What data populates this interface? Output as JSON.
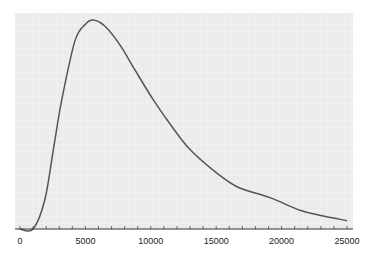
{
  "chart_data": {
    "type": "line",
    "title": "",
    "xlabel": "",
    "ylabel": "",
    "xlim": [
      0,
      25000
    ],
    "ylim": [
      0,
      1.05
    ],
    "grid": true,
    "legend": null,
    "x_ticks": [
      0,
      5000,
      10000,
      15000,
      20000,
      25000
    ],
    "x_tick_labels": [
      "0",
      "5000",
      "10000",
      "15000",
      "20000",
      "25000"
    ],
    "x_minor_tick_step": 1000,
    "series": [
      {
        "name": "curve",
        "color": "#555555",
        "x": [
          0,
          1000,
          1900,
          2600,
          3200,
          4200,
          5000,
          5600,
          6500,
          7650,
          8800,
          10170,
          11500,
          13000,
          15000,
          16670,
          19100,
          21400,
          23000,
          25000
        ],
        "y": [
          0.0,
          0.0,
          0.14,
          0.4,
          0.62,
          0.9,
          0.98,
          1.0,
          0.97,
          0.88,
          0.76,
          0.62,
          0.5,
          0.38,
          0.27,
          0.2,
          0.15,
          0.09,
          0.065,
          0.04
        ]
      }
    ]
  },
  "colors": {
    "plot_background": "#ebebeb",
    "grid": "#f6f6f6",
    "axis": "#333333",
    "line": "#555555"
  }
}
